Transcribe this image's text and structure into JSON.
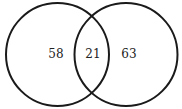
{
  "diagram": {
    "type": "venn",
    "sets": [
      {
        "name": "left",
        "only_count": "58"
      },
      {
        "name": "right",
        "only_count": "63"
      }
    ],
    "intersection_count": "21",
    "stroke_color": "#1a1a1a"
  }
}
